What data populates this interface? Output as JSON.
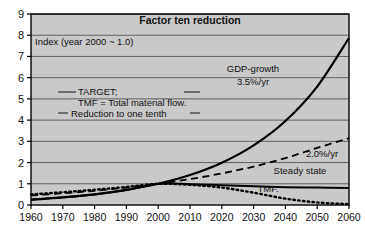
{
  "figure": {
    "title": "Factor ten reduction",
    "index_note": "Index (year 2000 ~ 1.0)",
    "annotation": {
      "line1": "TARGET;",
      "line2": "TMF = Total material flow.",
      "line3": "Reduction to one tenth"
    }
  },
  "colors": {
    "plot_background": "#c9c9c9",
    "frame": "#000000",
    "gridline": "#555555",
    "series": "#000000",
    "text": "#111111"
  },
  "chart_data": {
    "type": "line",
    "title": "Factor ten reduction",
    "xlabel": "",
    "ylabel": "Index (year 2000 ~ 1.0)",
    "xlim": [
      1960,
      2060
    ],
    "ylim": [
      0,
      9
    ],
    "grid": true,
    "legend_position": "inline-annotations",
    "xticks": [
      1960,
      1970,
      1980,
      1990,
      2000,
      2010,
      2020,
      2030,
      2040,
      2050,
      2060
    ],
    "yticks": [
      0,
      1,
      2,
      3,
      4,
      5,
      6,
      7,
      8,
      9
    ],
    "x": [
      1960,
      1970,
      1980,
      1990,
      2000,
      2010,
      2020,
      2030,
      2040,
      2050,
      2060
    ],
    "series": [
      {
        "name": "GDP-growth 3.5%/yr",
        "label": "GDP-growth",
        "sublabel": "3.5%/yr",
        "style": "solid",
        "width": 2.2,
        "values": [
          0.25,
          0.36,
          0.5,
          0.71,
          1.0,
          1.41,
          1.99,
          2.81,
          3.96,
          5.58,
          7.87
        ]
      },
      {
        "name": "2.0%/yr",
        "label": "2.0%/yr",
        "sublabel": "",
        "style": "dashed",
        "width": 1.8,
        "values": [
          0.45,
          0.55,
          0.67,
          0.82,
          1.0,
          1.22,
          1.49,
          1.81,
          2.21,
          2.69,
          3.15
        ]
      },
      {
        "name": "Steady state",
        "label": "Steady state",
        "sublabel": "",
        "style": "solid",
        "width": 2.0,
        "values": [
          0.25,
          0.36,
          0.5,
          0.71,
          1.0,
          0.98,
          0.93,
          0.88,
          0.84,
          0.82,
          0.8
        ]
      },
      {
        "name": "TMF",
        "label": "TMF.",
        "sublabel": "",
        "style": "dotted",
        "width": 2.4,
        "values": [
          0.5,
          0.6,
          0.72,
          0.85,
          1.0,
          0.95,
          0.82,
          0.58,
          0.3,
          0.12,
          0.04
        ]
      }
    ],
    "annotations": [
      "TARGET;",
      "TMF = Total material flow.",
      "Reduction to one tenth",
      "Index (year 2000 ~ 1.0)"
    ]
  }
}
